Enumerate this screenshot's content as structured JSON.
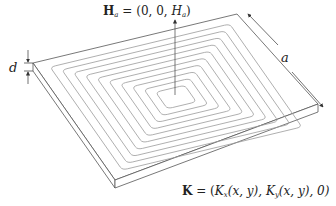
{
  "diagram": {
    "type": "planar-spiral-coil-on-plate",
    "labels": {
      "field": {
        "symbol": "H",
        "subscript": "a",
        "equals": " = (0, 0, ",
        "component": "H",
        "component_sub": "a",
        "close": ")"
      },
      "current": {
        "symbol": "K",
        "equals": " = (",
        "kx": "K",
        "kx_sub": "x",
        "args1": "(x, y), ",
        "ky": "K",
        "ky_sub": "y",
        "args2": "(x, y), 0)"
      },
      "thickness": "d",
      "side_length": "a"
    },
    "colors": {
      "plate_edge": "#555555",
      "spiral": "#9a9a9a",
      "arrows": "#333333",
      "text": "#222222"
    },
    "spiral_turns": 10
  }
}
